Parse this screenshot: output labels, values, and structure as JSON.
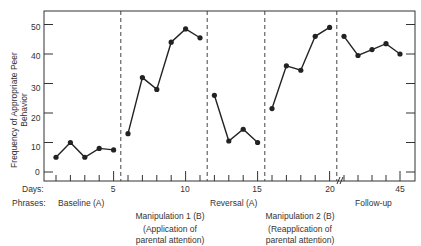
{
  "chart_data": {
    "type": "line",
    "title": "",
    "xlabel": "Days",
    "ylabel": "Frequency of Appropriate Peer Behavior",
    "ylim": [
      0,
      55
    ],
    "yticks": [
      0,
      10,
      20,
      30,
      40,
      50
    ],
    "xtick_labels": [
      "5",
      "10",
      "15",
      "20",
      "45"
    ],
    "grid": false,
    "legend": null,
    "axis_break_after_day": 20,
    "phases_label": "Phrases:",
    "days_label": "Days:",
    "phases": [
      {
        "name": "Baseline (A)",
        "days": [
          1,
          2,
          3,
          4,
          5
        ],
        "values": [
          5,
          10,
          5,
          8,
          7.5
        ]
      },
      {
        "name": "Manipulation 1 (B)",
        "subtitle": "(Application of parental attention)",
        "days": [
          6,
          7,
          8,
          9,
          10,
          11
        ],
        "values": [
          13,
          32,
          28,
          44,
          48.5,
          45.5
        ]
      },
      {
        "name": "Reversal (A)",
        "days": [
          12,
          13,
          14,
          15
        ],
        "values": [
          26,
          10.5,
          14.5,
          10
        ]
      },
      {
        "name": "Manipulation 2 (B)",
        "subtitle": "(Reapplication of parental attention)",
        "days": [
          16,
          17,
          18,
          19,
          20
        ],
        "values": [
          21.5,
          36,
          34.5,
          46,
          49
        ]
      },
      {
        "name": "Follow-up",
        "days": [
          41,
          42,
          43,
          44,
          45
        ],
        "values": [
          46,
          39.5,
          41.5,
          43.5,
          40
        ]
      }
    ],
    "phase_dividers_after_day": [
      5.5,
      11.5,
      15.5,
      20.5
    ]
  },
  "labels": {
    "days": "Days:",
    "phrases": "Phrases:",
    "ylabel_line1": "Frequency of Appropriate Peer",
    "ylabel_line2": "Behavior",
    "baseline": "Baseline  (A)",
    "manip1": "Manipulation 1  (B)",
    "manip1_sub1": "(Application of",
    "manip1_sub2": "parental attention)",
    "reversal": "Reversal  (A)",
    "manip2": "Manipulation 2  (B)",
    "manip2_sub1": "(Reapplication of",
    "manip2_sub2": "parental attention)",
    "followup": "Follow-up",
    "x5": "5",
    "x10": "10",
    "x15": "15",
    "x20": "20",
    "x45": "45",
    "y0": "0",
    "y10": "10",
    "y20": "20",
    "y30": "30",
    "y40": "40",
    "y50": "50"
  }
}
